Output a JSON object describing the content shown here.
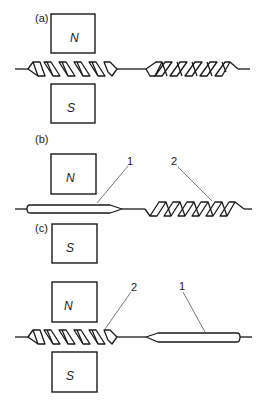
{
  "figure": {
    "type": "reed-switch-magnetic-diagram",
    "panels": [
      {
        "id": "a",
        "label": "(a)",
        "magnet_top": "N",
        "magnet_bottom": "S",
        "left_element": "coil",
        "right_element": "coil",
        "callouts": []
      },
      {
        "id": "b",
        "label": "(b)",
        "magnet_top": "N",
        "magnet_bottom": "S",
        "left_element": "bar",
        "right_element": "coil",
        "callouts": [
          {
            "number": "1",
            "target": "bar"
          },
          {
            "number": "2",
            "target": "coil"
          }
        ]
      },
      {
        "id": "c",
        "label": "(c)",
        "magnet_top": "N",
        "magnet_bottom": "S",
        "left_element": "coil",
        "right_element": "bar",
        "callouts": [
          {
            "number": "2",
            "target": "coil"
          },
          {
            "number": "1",
            "target": "bar"
          }
        ]
      }
    ],
    "colors": {
      "ink": "#1a1a1a",
      "leader": "#555555",
      "background": "#ffffff"
    }
  }
}
